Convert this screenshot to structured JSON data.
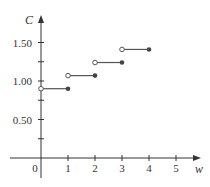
{
  "chart_data": {
    "type": "line",
    "subtype": "step",
    "title": "",
    "xlabel": "w",
    "ylabel": "C",
    "xlim": [
      -1.1,
      5.9
    ],
    "ylim": [
      0,
      1.8
    ],
    "x_ticks": [
      0,
      1,
      2,
      3,
      4,
      5
    ],
    "x_tick_labels": [
      "0",
      "1",
      "2",
      "3",
      "4",
      "5"
    ],
    "y_ticks": [
      0.25,
      0.5,
      0.75,
      1.0,
      1.25,
      1.5
    ],
    "y_tick_labels": [
      {
        "value": 0.5,
        "label": "0.50"
      },
      {
        "value": 1.0,
        "label": "1.00"
      },
      {
        "value": 1.5,
        "label": "1.50"
      }
    ],
    "grid": false,
    "legend": null,
    "series": [
      {
        "name": "C(w)",
        "segments": [
          {
            "x_start": 0,
            "x_end": 1,
            "y": 0.9,
            "start": "open",
            "end": "closed"
          },
          {
            "x_start": 1,
            "x_end": 2,
            "y": 1.07,
            "start": "open",
            "end": "closed"
          },
          {
            "x_start": 2,
            "x_end": 3,
            "y": 1.24,
            "start": "open",
            "end": "closed"
          },
          {
            "x_start": 3,
            "x_end": 4,
            "y": 1.41,
            "start": "open",
            "end": "closed"
          }
        ]
      }
    ]
  },
  "colors": {
    "axis": "#333333",
    "line": "#555555",
    "closed_dot": "#444444",
    "open_dot_fill": "#ffffff"
  }
}
